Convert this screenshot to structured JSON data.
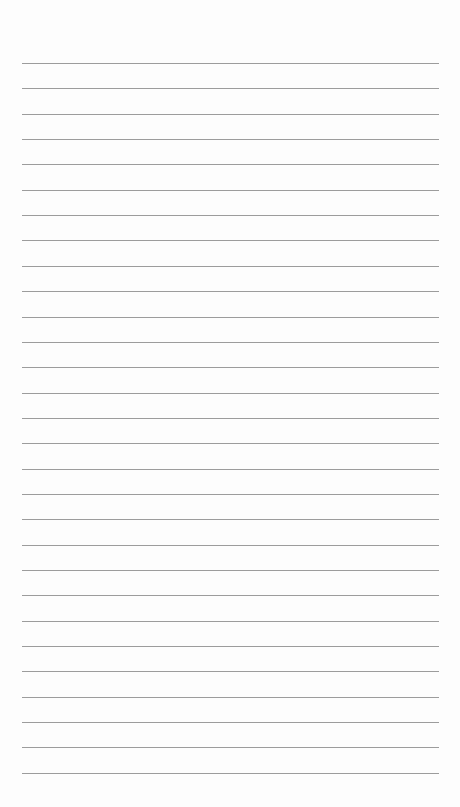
{
  "page": {
    "type": "lined-paper",
    "background_color": "#fdfdfd",
    "line_color": "#9c9c9c",
    "line_count": 29,
    "first_line_y": 63,
    "line_spacing": 25.35,
    "line_left": 22,
    "line_width": 417
  }
}
